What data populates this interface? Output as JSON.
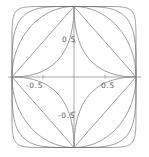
{
  "figure": {
    "title": "",
    "background": "#ffffff",
    "width": 149,
    "height": 157
  },
  "axes": {
    "x_axis_name": "x-axis",
    "y_axis_name": "y-axis",
    "axis_color": "#808080",
    "origin_px": {
      "x": 74,
      "y": 77
    },
    "x_range": [
      -1.12,
      1.12
    ],
    "y_range": [
      -1.12,
      1.12
    ],
    "grid": false,
    "tick_labels": {
      "y_positive": "0.5",
      "y_negative": "-0.5",
      "x_negative": "-0.5",
      "x_positive": "0.5"
    },
    "tick_values": [
      -0.5,
      0.5
    ]
  },
  "chart_data": {
    "type": "line",
    "title": "",
    "xlabel": "",
    "ylabel": "",
    "xlim": [
      -1.12,
      1.12
    ],
    "ylim": [
      -1.12,
      1.12
    ],
    "grid": false,
    "legend": "none",
    "equation": "|x|^n + |y|^n = 1",
    "xticks": [
      -0.5,
      0.5
    ],
    "yticks": [
      -0.5,
      0.5
    ],
    "xticklabels": [
      "-0.5",
      "0.5"
    ],
    "yticklabels": [
      "-0.5",
      "0.5"
    ],
    "series": [
      {
        "name": "n = 0.5",
        "exponent": 0.5,
        "color": "#6e6e6e",
        "style": "concave-astroid"
      },
      {
        "name": "n = 1",
        "exponent": 1.0,
        "color": "#6e6e6e",
        "style": "diamond"
      },
      {
        "name": "n = 2",
        "exponent": 2.0,
        "color": "#6e6e6e",
        "style": "circle"
      },
      {
        "name": "n = 4",
        "exponent": 4.0,
        "color": "#6e6e6e",
        "style": "squircle"
      },
      {
        "name": "n = 10",
        "exponent": 10.0,
        "color": "#6e6e6e",
        "style": "rounded-square"
      }
    ],
    "shared_points": [
      {
        "x": 1,
        "y": 0
      },
      {
        "x": 0,
        "y": 1
      },
      {
        "x": -1,
        "y": 0
      },
      {
        "x": 0,
        "y": -1
      }
    ]
  }
}
